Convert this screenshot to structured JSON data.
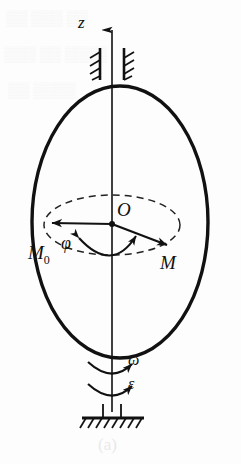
{
  "figure": {
    "domain_note": "mechanics diagram: rotating ellipsoidal body on vertical shaft",
    "canvas": {
      "width": 241,
      "height": 464,
      "background": "#fdfdfd"
    },
    "caption": "(a)",
    "ink_color": "#111111",
    "dash_color": "#222222",
    "labels": {
      "axis_z": "z",
      "center_O": "O",
      "point_M0": "M",
      "point_M0_sub": "0",
      "point_M": "M",
      "angle_phi": "φ",
      "angular_velocity": "ω",
      "angular_acceleration": "ε"
    },
    "body": {
      "name": "ellipsoid-outline",
      "center_x": 120,
      "center_y": 222,
      "radius_x": 88,
      "radius_y": 136,
      "stroke_width": 3.4
    },
    "rotation_path": {
      "name": "dashed-rotation-circle",
      "center_x": 112,
      "center_y": 225,
      "radius_x": 68,
      "radius_y": 30,
      "dash_pattern": "7 5",
      "stroke_width": 1.5
    },
    "axis": {
      "name": "z-axis",
      "x": 112,
      "y_top": 25,
      "y_bottom": 412,
      "arrow_tip_y": 25,
      "stroke_width": 1.6
    },
    "bearings": [
      {
        "name": "bearing-left",
        "x": 100,
        "y_top": 48,
        "y_bottom": 80
      },
      {
        "name": "bearing-right",
        "x": 124,
        "y_top": 48,
        "y_bottom": 80
      }
    ],
    "radius_vectors": [
      {
        "name": "radius-to-M0",
        "from_x": 112,
        "from_y": 224,
        "to_x": 47,
        "to_y": 223
      },
      {
        "name": "radius-to-M",
        "from_x": 112,
        "from_y": 224,
        "to_x": 172,
        "to_y": 247
      }
    ],
    "angle_arc": {
      "name": "phi-angle-arc",
      "start_x": 75,
      "start_y": 240,
      "end_x": 138,
      "end_y": 238,
      "sweep_y": 262
    },
    "spin_arrows": [
      {
        "name": "omega-curved-arrow",
        "y_center": 366
      },
      {
        "name": "epsilon-curved-arrow",
        "y_center": 388
      }
    ],
    "ground": {
      "name": "fixed-support",
      "x_left": 82,
      "x_right": 144,
      "y": 418,
      "hatch_count": 8,
      "post_left_x": 103,
      "post_right_x": 121,
      "post_top_y": 404
    }
  }
}
